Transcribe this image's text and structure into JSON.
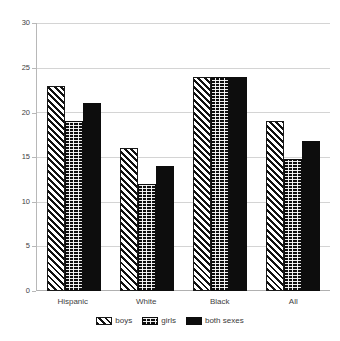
{
  "chart_data": {
    "type": "bar",
    "title": "",
    "subtitle": "",
    "xlabel": "",
    "ylabel": "",
    "categories": [
      "Hispanic",
      "White",
      "Black",
      "All"
    ],
    "series": [
      {
        "name": "boys",
        "pattern": "diagonal-stripes",
        "values": [
          23,
          16,
          24,
          19
        ]
      },
      {
        "name": "girls",
        "pattern": "dotted-grid",
        "values": [
          19,
          12,
          24,
          14.8
        ]
      },
      {
        "name": "both sexes",
        "pattern": "solid-black",
        "values": [
          21,
          14,
          24,
          16.8
        ]
      }
    ],
    "ylim": [
      0,
      30
    ],
    "yticks": [
      0,
      5,
      10,
      15,
      20,
      25,
      30
    ],
    "ytick_labels": [
      "0",
      "5",
      "10",
      "15",
      "20",
      "25",
      "30"
    ],
    "grid": true,
    "legend_position": "bottom",
    "colors": {
      "ink": "#0d0d0d",
      "gridline": "#d4d4d4",
      "axis": "#b8b8b8",
      "background": "#ffffff",
      "text": "#3f3f3f"
    }
  },
  "legend": {
    "items": [
      {
        "label": "boys"
      },
      {
        "label": "girls"
      },
      {
        "label": "both sexes"
      }
    ]
  },
  "yaxis": {
    "t0": "0",
    "t1": "5",
    "t2": "10",
    "t3": "15",
    "t4": "20",
    "t5": "25",
    "t6": "30"
  },
  "xaxis": {
    "c0": "Hispanic",
    "c1": "White",
    "c2": "Black",
    "c3": "All"
  }
}
